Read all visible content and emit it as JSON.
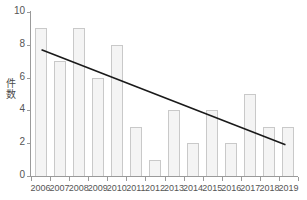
{
  "chart_data": {
    "type": "bar",
    "title": "",
    "subtitle": "",
    "xlabel": "",
    "ylabel": "件数",
    "categories": [
      "2006",
      "2007",
      "2008",
      "2009",
      "2010",
      "2011",
      "2012",
      "2013",
      "2014",
      "2015",
      "2016",
      "2017",
      "2018",
      "2019"
    ],
    "values": [
      9,
      7,
      9,
      6,
      8,
      3,
      1,
      4,
      2,
      4,
      2,
      5,
      3,
      3
    ],
    "series": [
      {
        "name": "件数",
        "type": "bar",
        "values": [
          9,
          7,
          9,
          6,
          8,
          3,
          1,
          4,
          2,
          4,
          2,
          5,
          3,
          3
        ]
      },
      {
        "name": "trendline",
        "type": "line",
        "x": [
          "2006",
          "2019"
        ],
        "values": [
          7.7,
          1.9
        ]
      }
    ],
    "ylim": [
      0,
      10
    ],
    "yticks": [
      0,
      2,
      4,
      6,
      8,
      10
    ],
    "ytick_labels": [
      "0",
      "2",
      "4",
      "6",
      "8",
      "10"
    ],
    "grid": false,
    "legend": "none",
    "annotations": [],
    "colors": {
      "bar_fill": "#f4f4f4",
      "bar_border": "#c9c9c9",
      "axis": "#9a9a9a",
      "tick_text": "#555555",
      "axis_title": "#4a4a4a",
      "trendline": "#1a1a1a",
      "background": "#ffffff"
    }
  },
  "y_axis_title_chars": [
    "件",
    "数"
  ]
}
